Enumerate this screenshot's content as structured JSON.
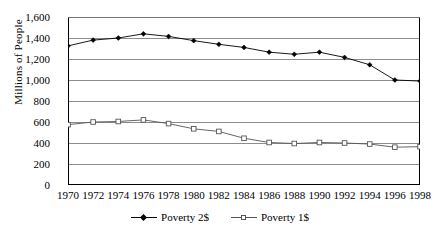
{
  "chart_data": {
    "type": "line",
    "title": "",
    "xlabel": "",
    "ylabel": "Millions of People",
    "x": [
      1970,
      1972,
      1974,
      1976,
      1978,
      1980,
      1982,
      1984,
      1986,
      1988,
      1990,
      1992,
      1994,
      1996,
      1998
    ],
    "categories": [
      "1970",
      "1972",
      "1974",
      "1976",
      "1978",
      "1980",
      "1982",
      "1984",
      "1986",
      "1988",
      "1990",
      "1992",
      "1994",
      "1996",
      "1998"
    ],
    "ylim": [
      0,
      1600
    ],
    "yticks": [
      0,
      200,
      400,
      600,
      800,
      1000,
      1200,
      1400,
      1600
    ],
    "ytick_labels": [
      "0",
      "200",
      "400",
      "600",
      "800",
      "1,000",
      "1,200",
      "1,400",
      "1,600"
    ],
    "grid": true,
    "legend_position": "bottom",
    "series": [
      {
        "name": "Poverty 2$",
        "marker": "diamond",
        "color": "#000000",
        "values": [
          1325,
          1380,
          1400,
          1440,
          1415,
          1375,
          1340,
          1310,
          1265,
          1245,
          1265,
          1215,
          1145,
          1000,
          990
        ]
      },
      {
        "name": "Poverty 1$",
        "marker": "square",
        "color": "#555555",
        "values": [
          575,
          600,
          605,
          620,
          585,
          535,
          510,
          445,
          405,
          395,
          405,
          400,
          390,
          360,
          365
        ]
      }
    ]
  },
  "legend": {
    "items": [
      {
        "label": "Poverty 2$",
        "marker": "diamond-marker"
      },
      {
        "label": "Poverty 1$",
        "marker": "square-marker"
      }
    ]
  }
}
